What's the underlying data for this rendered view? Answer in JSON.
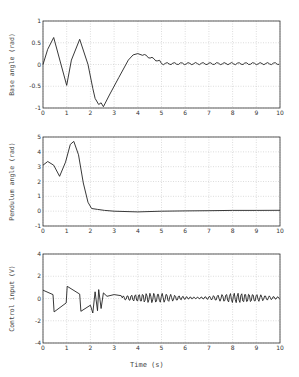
{
  "figure": {
    "xlabel": "Time (s)"
  },
  "chart_data": [
    {
      "type": "line",
      "title": "",
      "xlabel": "",
      "ylabel": "Base angle (rad)",
      "xlim": [
        0,
        10
      ],
      "ylim": [
        -1,
        1
      ],
      "xticks": [
        0,
        1,
        2,
        3,
        4,
        5,
        6,
        7,
        8,
        9,
        10
      ],
      "yticks": [
        -1,
        -0.5,
        0,
        0.5,
        1
      ],
      "ytick_labels": [
        "-1",
        "-0.5",
        "0",
        "0.5",
        "1"
      ],
      "grid": true,
      "x": [
        0,
        0.2,
        0.45,
        1.0,
        1.2,
        1.55,
        1.9,
        2.1,
        2.2,
        2.35,
        2.45,
        2.55,
        2.8,
        3.2,
        3.6,
        3.8,
        4.0,
        4.2,
        4.5,
        5.0,
        5.5,
        6,
        7,
        8,
        9,
        10
      ],
      "y": [
        0.0,
        0.35,
        0.62,
        -0.48,
        0.1,
        0.58,
        0.0,
        -0.55,
        -0.78,
        -0.92,
        -0.88,
        -0.97,
        -0.7,
        -0.3,
        0.1,
        0.22,
        0.25,
        0.23,
        0.15,
        0.05,
        0.02,
        0.0,
        0.02,
        0.03,
        0.02,
        0.03
      ]
    },
    {
      "type": "line",
      "title": "",
      "xlabel": "",
      "ylabel": "Pendulum angle (rad)",
      "xlim": [
        0,
        10
      ],
      "ylim": [
        -1,
        5
      ],
      "xticks": [
        0,
        1,
        2,
        3,
        4,
        5,
        6,
        7,
        8,
        9,
        10
      ],
      "yticks": [
        -1,
        0,
        1,
        2,
        3,
        4,
        5
      ],
      "grid": true,
      "x": [
        0,
        0.2,
        0.45,
        0.7,
        0.95,
        1.15,
        1.3,
        1.5,
        1.7,
        1.9,
        2.05,
        2.3,
        2.6,
        3.0,
        4,
        5,
        6,
        7,
        8,
        9,
        10
      ],
      "y": [
        3.1,
        3.35,
        3.1,
        2.35,
        3.3,
        4.5,
        4.7,
        3.8,
        1.9,
        0.6,
        0.18,
        0.12,
        0.05,
        0.0,
        -0.05,
        0.0,
        0.02,
        0.03,
        0.05,
        0.05,
        0.06
      ]
    },
    {
      "type": "line",
      "title": "",
      "xlabel": "Time (s)",
      "ylabel": "Control input (V)",
      "xlim": [
        0,
        10
      ],
      "ylim": [
        -4,
        4
      ],
      "xticks": [
        0,
        1,
        2,
        3,
        4,
        5,
        6,
        7,
        8,
        9,
        10
      ],
      "yticks": [
        -4,
        -2,
        0,
        2,
        4
      ],
      "grid": true,
      "x": [
        0,
        0.42,
        0.47,
        0.98,
        1.02,
        1.55,
        1.6,
        2.0,
        2.1,
        2.2,
        2.3,
        2.35,
        2.45,
        2.55,
        2.7,
        3.0,
        3.3
      ],
      "y": [
        0.75,
        0.35,
        -1.2,
        -0.4,
        1.1,
        0.4,
        -1.15,
        -0.6,
        -1.3,
        0.6,
        -1.1,
        0.8,
        -0.9,
        0.5,
        0.2,
        0.35,
        0.25
      ],
      "oscillation_after_3s": {
        "center": 0.0,
        "amplitude": 0.45,
        "frequency_hz": 6
      }
    }
  ]
}
